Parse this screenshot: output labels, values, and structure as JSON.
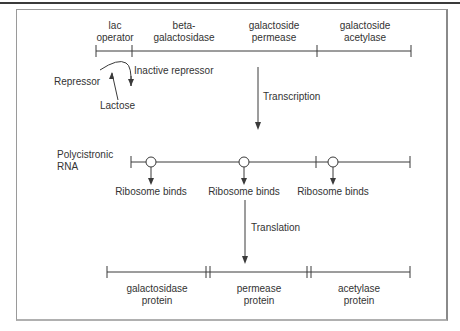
{
  "gene_labels": {
    "lac_operator": [
      "lac",
      "operator"
    ],
    "beta_galactosidase": [
      "beta-",
      "galactosidase"
    ],
    "galactoside_permease": [
      "galactoside",
      "permease"
    ],
    "galactoside_acetylase": [
      "galactoside",
      "acetylase"
    ]
  },
  "regulation": {
    "repressor": "Repressor",
    "inactive_repressor": "Inactive repressor",
    "lactose": "Lactose"
  },
  "process": {
    "transcription": "Transcription",
    "translation": "Translation"
  },
  "rna": {
    "label": [
      "Polycistronic",
      "RNA"
    ],
    "ribosome_binds": [
      "Ribosome binds",
      "Ribosome binds",
      "Ribosome binds"
    ]
  },
  "proteins": [
    [
      "galactosidase",
      "protein"
    ],
    [
      "permease",
      "protein"
    ],
    [
      "acetylase",
      "protein"
    ]
  ],
  "colors": {
    "line": "#3a3a3a",
    "text": "#333333",
    "frame": "#9a9a9a"
  }
}
